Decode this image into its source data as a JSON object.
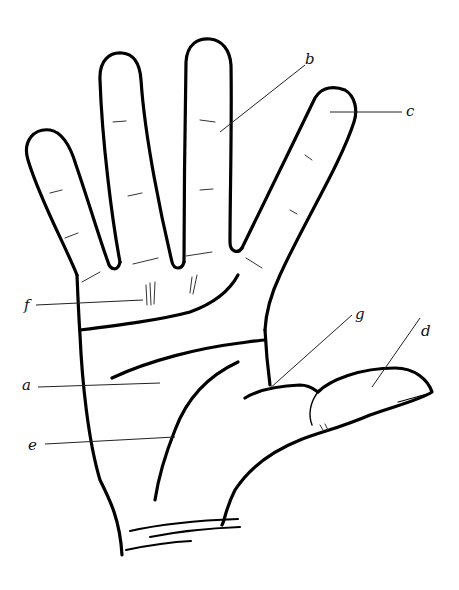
{
  "figure": {
    "colors": {
      "stroke": "#000000",
      "background": "#ffffff",
      "leader": "#222222"
    }
  },
  "labels": [
    {
      "id": "a",
      "text": "a",
      "x": 22,
      "y": 378
    },
    {
      "id": "b",
      "text": "b",
      "x": 305,
      "y": 52
    },
    {
      "id": "c",
      "text": "c",
      "x": 406,
      "y": 104
    },
    {
      "id": "d",
      "text": "d",
      "x": 421,
      "y": 324
    },
    {
      "id": "e",
      "text": "e",
      "x": 28,
      "y": 438
    },
    {
      "id": "f",
      "text": "f",
      "x": 24,
      "y": 298
    },
    {
      "id": "g",
      "text": "g",
      "x": 355,
      "y": 307
    }
  ]
}
